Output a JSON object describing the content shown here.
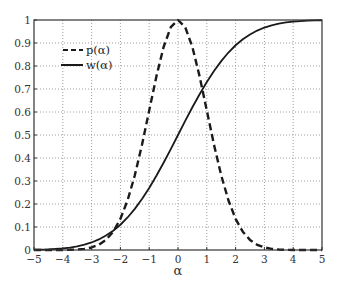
{
  "chart_data": {
    "type": "line",
    "title": "",
    "xlabel": "α",
    "ylabel": "",
    "xlim": [
      -5,
      5
    ],
    "ylim": [
      0,
      1
    ],
    "grid": true,
    "grid_style": "dotted",
    "legend_position": "upper-left",
    "x_ticks": [
      -5,
      -4,
      -3,
      -2,
      -1,
      0,
      1,
      2,
      3,
      4,
      5
    ],
    "x_tick_labels": [
      "−5",
      "−4",
      "−3",
      "−2",
      "−1",
      "0",
      "1",
      "2",
      "3",
      "4",
      "5"
    ],
    "y_ticks": [
      0,
      0.1,
      0.2,
      0.3,
      0.4,
      0.5,
      0.6,
      0.7,
      0.8,
      0.9,
      1
    ],
    "y_tick_labels": [
      "0",
      "0.1",
      "0.2",
      "0.3",
      "0.4",
      "0.5",
      "0.6",
      "0.7",
      "0.8",
      "0.9",
      "1"
    ],
    "x": [
      -5,
      -4.75,
      -4.5,
      -4.25,
      -4,
      -3.75,
      -3.5,
      -3.25,
      -3,
      -2.75,
      -2.5,
      -2.25,
      -2,
      -1.75,
      -1.5,
      -1.25,
      -1,
      -0.75,
      -0.5,
      -0.25,
      0,
      0.25,
      0.5,
      0.75,
      1,
      1.25,
      1.5,
      1.75,
      2,
      2.25,
      2.5,
      2.75,
      3,
      3.25,
      3.5,
      3.75,
      4,
      4.25,
      4.5,
      4.75,
      5
    ],
    "series": [
      {
        "name": "p(α)",
        "style": "dashed",
        "color": "#1a1a1a",
        "values": [
          0.0,
          0.0,
          0.0,
          0.0001,
          0.0003,
          0.0009,
          0.0022,
          0.0051,
          0.0111,
          0.0228,
          0.0439,
          0.0796,
          0.1353,
          0.2163,
          0.3247,
          0.4578,
          0.6065,
          0.7548,
          0.8825,
          0.9692,
          1.0,
          0.9692,
          0.8825,
          0.7548,
          0.6065,
          0.4578,
          0.3247,
          0.2163,
          0.1353,
          0.0796,
          0.0439,
          0.0228,
          0.0111,
          0.0051,
          0.0022,
          0.0009,
          0.0003,
          0.0001,
          0.0,
          0.0,
          0.0
        ]
      },
      {
        "name": "w(α)",
        "style": "solid",
        "color": "#1a1a1a",
        "values": [
          0.0011,
          0.0018,
          0.0028,
          0.0046,
          0.007,
          0.0107,
          0.0159,
          0.0231,
          0.0328,
          0.0459,
          0.0627,
          0.0838,
          0.1098,
          0.1414,
          0.1788,
          0.2215,
          0.2698,
          0.3226,
          0.3795,
          0.4389,
          0.5,
          0.5611,
          0.6205,
          0.6774,
          0.7302,
          0.7785,
          0.8212,
          0.8586,
          0.8902,
          0.9162,
          0.9373,
          0.9541,
          0.9672,
          0.9769,
          0.9841,
          0.9893,
          0.993,
          0.9954,
          0.9972,
          0.9982,
          0.9989
        ]
      }
    ]
  },
  "legend": {
    "items": [
      {
        "label": "p(α)",
        "style": "dashed"
      },
      {
        "label": "w(α)",
        "style": "solid"
      }
    ]
  },
  "axes": {
    "xlabel": "α"
  }
}
